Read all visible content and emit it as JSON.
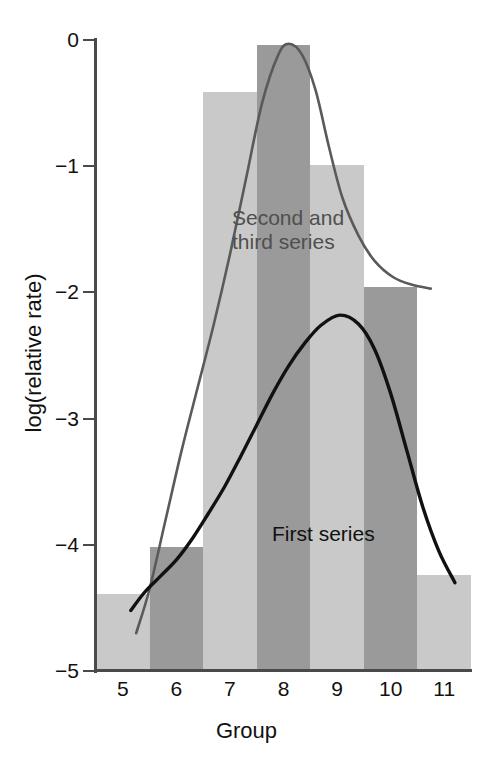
{
  "chart_data": {
    "type": "bar",
    "title": "",
    "subtitle": "",
    "xlabel": "Group",
    "ylabel": "log(relative rate)",
    "categories": [
      "5",
      "6",
      "7",
      "8",
      "9",
      "10",
      "11"
    ],
    "xlim": [
      4.5,
      11.5
    ],
    "ylim": [
      -5,
      0
    ],
    "y_ticks": [
      "0",
      "−1",
      "−2",
      "−3",
      "−4",
      "−5"
    ],
    "y_tick_values": [
      0,
      -1,
      -2,
      -3,
      -4,
      -5
    ],
    "grid": false,
    "legend_position": "inline-annotations",
    "series": [
      {
        "name": "First series",
        "style": "bar-light",
        "color": "#c9c9c9",
        "values": [
          -4.39,
          -4.33,
          -0.41,
          -2.96,
          -0.99,
          -2.82,
          -4.24
        ]
      },
      {
        "name": "Second and third series",
        "style": "bar-dark",
        "color": "#9a9a9a",
        "values": [
          null,
          -4.02,
          null,
          -0.04,
          null,
          -1.96,
          null
        ]
      },
      {
        "name": "First series",
        "style": "curve-black",
        "color": "#111111",
        "peak_x": 9.05,
        "peak_y": -2.18,
        "x": [
          5.15,
          5.4,
          5.7,
          6.0,
          6.3,
          6.6,
          6.9,
          7.2,
          7.5,
          7.8,
          8.1,
          8.4,
          8.7,
          9.05,
          9.4,
          9.7,
          10.0,
          10.3,
          10.6,
          10.9,
          11.2
        ],
        "y": [
          -4.52,
          -4.38,
          -4.25,
          -4.12,
          -3.95,
          -3.75,
          -3.54,
          -3.3,
          -3.05,
          -2.8,
          -2.58,
          -2.4,
          -2.26,
          -2.18,
          -2.25,
          -2.45,
          -2.8,
          -3.25,
          -3.7,
          -4.05,
          -4.3
        ]
      },
      {
        "name": "Second and third series",
        "style": "curve-gray",
        "color": "#5a5a5a",
        "peak_x": 8.1,
        "peak_y": -0.03,
        "x": [
          5.25,
          5.5,
          5.8,
          6.1,
          6.4,
          6.7,
          7.0,
          7.3,
          7.6,
          7.9,
          8.1,
          8.35,
          8.6,
          8.85,
          9.1,
          9.4,
          9.7,
          10.05,
          10.4,
          10.75
        ],
        "y": [
          -4.7,
          -4.35,
          -3.8,
          -3.25,
          -2.75,
          -2.25,
          -1.7,
          -1.1,
          -0.5,
          -0.12,
          -0.03,
          -0.12,
          -0.4,
          -0.85,
          -1.25,
          -1.55,
          -1.75,
          -1.88,
          -1.94,
          -1.97
        ]
      }
    ],
    "annotations": [
      {
        "text": "Second and\nthird series",
        "x": 7.65,
        "y": -1.35,
        "color": "#4f4f4f"
      },
      {
        "text": "First series",
        "x": 8.8,
        "y": -3.85,
        "color": "#111111"
      }
    ]
  },
  "axes": {
    "x_title": "Group",
    "y_title": "log(relative rate)",
    "x_tick_labels": [
      "5",
      "6",
      "7",
      "8",
      "9",
      "10",
      "11"
    ],
    "y_tick_labels": [
      "0",
      "−1",
      "−2",
      "−3",
      "−4",
      "−5"
    ]
  },
  "annotations": {
    "second_third": "Second and\nthird series",
    "first": "First series"
  },
  "colors": {
    "bar_light": "#c9c9c9",
    "bar_dark": "#9a9a9a",
    "curve_black": "#111111",
    "curve_gray": "#5a5a5a",
    "axis": "#4a4a4a",
    "background": "#ffffff"
  }
}
